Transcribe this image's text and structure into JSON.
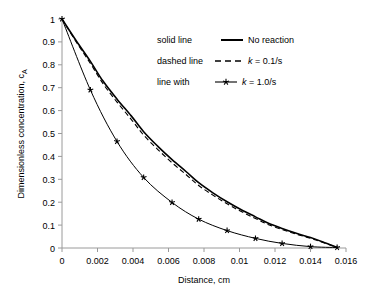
{
  "chart_data": {
    "type": "line",
    "title": "",
    "xlabel": "Distance, cm",
    "ylabel": "Dimensionless concentration, c",
    "ylabel_subscript": "A",
    "xlim": [
      0,
      0.016
    ],
    "ylim": [
      0,
      1
    ],
    "grid": false,
    "legend_position": "upper-right-inside",
    "xticks": [
      "0",
      "0.002",
      "0.004",
      "0.006",
      "0.008",
      "0.01",
      "0.012",
      "0.014",
      "0.016"
    ],
    "xtick_values": [
      0,
      0.002,
      0.004,
      0.006,
      0.008,
      0.01,
      0.012,
      0.014,
      0.016
    ],
    "yticks": [
      "0",
      "0.1",
      "0.2",
      "0.3",
      "0.4",
      "0.5",
      "0.6",
      "0.7",
      "0.8",
      "0.9",
      "1"
    ],
    "ytick_values": [
      0,
      0.1,
      0.2,
      0.3,
      0.4,
      0.5,
      0.6,
      0.7,
      0.8,
      0.9,
      1
    ],
    "series": [
      {
        "name": "No reaction",
        "style": "solid",
        "color": "#000000",
        "marker": "none",
        "x": [
          0,
          0.0008,
          0.0016,
          0.0023,
          0.0031,
          0.0039,
          0.0046,
          0.0054,
          0.0062,
          0.007,
          0.0077,
          0.0085,
          0.0093,
          0.0101,
          0.0109,
          0.0116,
          0.0124,
          0.0132,
          0.014,
          0.0147,
          0.0155
        ],
        "values": [
          1.0,
          0.905,
          0.815,
          0.73,
          0.65,
          0.577,
          0.508,
          0.444,
          0.386,
          0.333,
          0.285,
          0.241,
          0.202,
          0.167,
          0.136,
          0.109,
          0.0855,
          0.0645,
          0.0455,
          0.0265,
          0.003
        ]
      },
      {
        "name": "k = 0.1/s",
        "style": "dashed",
        "color": "#000000",
        "marker": "none",
        "x": [
          0,
          0.0008,
          0.0016,
          0.0023,
          0.0031,
          0.0039,
          0.0046,
          0.0054,
          0.0062,
          0.007,
          0.0077,
          0.0085,
          0.0093,
          0.0101,
          0.0109,
          0.0116,
          0.0124,
          0.0132,
          0.014,
          0.0147,
          0.0155
        ],
        "values": [
          1.0,
          0.9,
          0.806,
          0.719,
          0.637,
          0.562,
          0.493,
          0.43,
          0.372,
          0.32,
          0.273,
          0.231,
          0.193,
          0.159,
          0.129,
          0.103,
          0.0805,
          0.0605,
          0.0425,
          0.0245,
          0.003
        ]
      },
      {
        "name": "k = 1.0/s",
        "style": "solid-with-markers",
        "color": "#000000",
        "marker": "star",
        "x": [
          0,
          0.0016,
          0.0031,
          0.0046,
          0.0062,
          0.0077,
          0.0093,
          0.0109,
          0.0124,
          0.014,
          0.0155
        ],
        "values": [
          1.0,
          0.69,
          0.465,
          0.308,
          0.199,
          0.126,
          0.076,
          0.042,
          0.02,
          0.006,
          0.002
        ]
      }
    ]
  },
  "legend": {
    "entries": [
      {
        "prefix": "solid line",
        "sample": "solid-line-sample",
        "label": "No reaction"
      },
      {
        "prefix": "dashed line",
        "sample": "dashed-line-sample",
        "label": "k = 0.1/s",
        "italic_lead": "k"
      },
      {
        "prefix": "line with",
        "sample": "marker-line-sample",
        "label": "k = 1.0/s",
        "italic_lead": "k"
      }
    ]
  }
}
